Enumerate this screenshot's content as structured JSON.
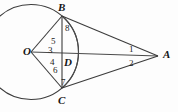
{
  "figure": {
    "background_color": "#fdfdfd",
    "stroke_color": "#3c3c3c",
    "text_color": "#161616"
  },
  "points": {
    "O": {
      "label": "O",
      "x": 31,
      "y": 52,
      "role": "circle-center"
    },
    "B": {
      "label": "B",
      "x": 62,
      "y": 16,
      "role": "circle-point-top"
    },
    "C": {
      "label": "C",
      "x": 62,
      "y": 88,
      "role": "circle-point-bottom"
    },
    "D": {
      "label": "D",
      "x": 62,
      "y": 52,
      "role": "chord-midpoint"
    },
    "A": {
      "label": "A",
      "x": 158,
      "y": 56,
      "role": "external-point"
    }
  },
  "point_labels": [
    {
      "name": "O",
      "text": "O",
      "left": 24,
      "top": 47
    },
    {
      "name": "B",
      "text": "B",
      "left": 58,
      "top": 2
    },
    {
      "name": "C",
      "text": "C",
      "left": 58,
      "top": 95
    },
    {
      "name": "D",
      "text": "D",
      "left": 64,
      "top": 58
    },
    {
      "name": "A",
      "text": "A",
      "left": 163,
      "top": 49
    }
  ],
  "angle_labels": [
    {
      "name": "angle-1",
      "text": "1",
      "left": 130,
      "top": 46
    },
    {
      "name": "angle-2",
      "text": "2",
      "left": 130,
      "top": 60
    },
    {
      "name": "angle-3",
      "text": "3",
      "left": 40,
      "top": 46
    },
    {
      "name": "angle-4",
      "text": "4",
      "left": 42,
      "top": 57
    },
    {
      "name": "angle-5",
      "text": "5",
      "left": 47,
      "top": 35
    },
    {
      "name": "angle-6",
      "text": "6",
      "left": 47,
      "top": 65
    },
    {
      "name": "angle-7",
      "text": "7",
      "left": 56,
      "top": 77
    },
    {
      "name": "angle-8",
      "text": "8",
      "left": 65,
      "top": 24
    }
  ],
  "circle": {
    "center_x": 31,
    "center_y": 52,
    "radius": 47.5
  },
  "segments": [
    {
      "name": "segment-OB",
      "x1": 31,
      "y1": 52,
      "x2": 62,
      "y2": 16
    },
    {
      "name": "segment-OC",
      "x1": 31,
      "y1": 52,
      "x2": 62,
      "y2": 88
    },
    {
      "name": "segment-OA",
      "x1": 31,
      "y1": 52,
      "x2": 158,
      "y2": 56
    },
    {
      "name": "segment-BC",
      "x1": 62,
      "y1": 16,
      "x2": 62,
      "y2": 88
    },
    {
      "name": "segment-BA",
      "x1": 62,
      "y1": 16,
      "x2": 158,
      "y2": 56
    },
    {
      "name": "segment-CA",
      "x1": 62,
      "y1": 88,
      "x2": 158,
      "y2": 56
    }
  ],
  "arc_BC": {
    "name": "arc-B-to-C",
    "start_x": 62,
    "start_y": 16,
    "end_x": 62,
    "end_y": 88,
    "radius": 47.5,
    "bulge_x": 95
  }
}
